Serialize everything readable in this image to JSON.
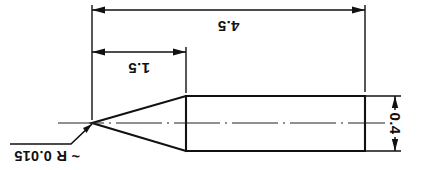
{
  "drawing": {
    "title": "Tapered pin profile drawing",
    "background_color": "#ffffff",
    "line_color": "#111111",
    "text_orientation": "rotated-180",
    "dimensions": {
      "overall_length": {
        "label": "4.5",
        "name": "overall-length-dimension",
        "orientation": "horizontal"
      },
      "taper_length": {
        "label": "1.5",
        "name": "taper-length-dimension",
        "orientation": "horizontal"
      },
      "body_diameter": {
        "label": "0.4",
        "name": "diameter-dimension",
        "orientation": "vertical"
      }
    },
    "notes": {
      "tip_radius": {
        "label": "~ R 0.015",
        "name": "tip-radius-note"
      }
    },
    "geometry": {
      "tip_x": 92,
      "tip_y": 123,
      "shoulder_x": 186,
      "body_end_x": 365,
      "body_top_y": 96,
      "body_bottom_y": 151,
      "centerline_y": 123
    }
  }
}
